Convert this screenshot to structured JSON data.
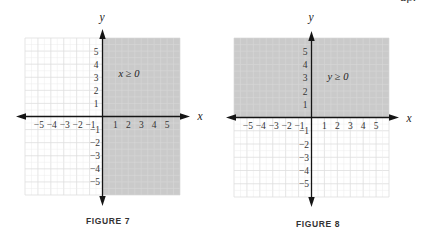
{
  "page": {
    "partial_text_visible": "up."
  },
  "colors": {
    "shade": "#cbcbcb",
    "grid_unshaded": "#dedede",
    "grid_shaded": "#d9d9d9",
    "axis": "#151515",
    "text": "#333333"
  },
  "figures": [
    {
      "caption": "FIGURE 7",
      "inequality": "x ≥ 0",
      "x_axis_label": "x",
      "y_axis_label": "y",
      "grid_extent": 6,
      "shaded_region": "x>=0",
      "x_ticks": [
        {
          "v": -5,
          "label": "−5"
        },
        {
          "v": -4,
          "label": "−4"
        },
        {
          "v": -3,
          "label": "−3"
        },
        {
          "v": -2,
          "label": "−2"
        },
        {
          "v": -1,
          "label": "−1"
        },
        {
          "v": 1,
          "label": "1"
        },
        {
          "v": 2,
          "label": "2"
        },
        {
          "v": 3,
          "label": "3"
        },
        {
          "v": 4,
          "label": "4"
        },
        {
          "v": 5,
          "label": "5"
        }
      ],
      "y_ticks": [
        {
          "v": 5,
          "label": "5"
        },
        {
          "v": 4,
          "label": "4"
        },
        {
          "v": 3,
          "label": "3"
        },
        {
          "v": 2,
          "label": "2"
        },
        {
          "v": 1,
          "label": "1"
        },
        {
          "v": -1,
          "label": "−1"
        },
        {
          "v": -2,
          "label": "−2"
        },
        {
          "v": -3,
          "label": "−3"
        },
        {
          "v": -4,
          "label": "−4"
        },
        {
          "v": -5,
          "label": "−5"
        }
      ]
    },
    {
      "caption": "FIGURE 8",
      "inequality": "y ≥ 0",
      "x_axis_label": "x",
      "y_axis_label": "y",
      "grid_extent": 6,
      "shaded_region": "y>=0",
      "x_ticks": [
        {
          "v": -5,
          "label": "−5"
        },
        {
          "v": -4,
          "label": "−4"
        },
        {
          "v": -3,
          "label": "−3"
        },
        {
          "v": -2,
          "label": "−2"
        },
        {
          "v": -1,
          "label": "−1"
        },
        {
          "v": 1,
          "label": "1"
        },
        {
          "v": 2,
          "label": "2"
        },
        {
          "v": 3,
          "label": "3"
        },
        {
          "v": 4,
          "label": "4"
        },
        {
          "v": 5,
          "label": "5"
        }
      ],
      "y_ticks": [
        {
          "v": 5,
          "label": "5"
        },
        {
          "v": 4,
          "label": "4"
        },
        {
          "v": 3,
          "label": "3"
        },
        {
          "v": 2,
          "label": "2"
        },
        {
          "v": 1,
          "label": "1"
        },
        {
          "v": -1,
          "label": "−1"
        },
        {
          "v": -2,
          "label": "−2"
        },
        {
          "v": -3,
          "label": "−3"
        },
        {
          "v": -4,
          "label": "−4"
        },
        {
          "v": -5,
          "label": "−5"
        }
      ]
    }
  ],
  "chart_data": [
    {
      "type": "area",
      "title": "FIGURE 7",
      "annotation": "x ≥ 0",
      "xlabel": "x",
      "ylabel": "y",
      "xlim": [
        -6,
        6
      ],
      "ylim": [
        -6,
        6
      ],
      "x_ticks": [
        -5,
        -4,
        -3,
        -2,
        -1,
        1,
        2,
        3,
        4,
        5
      ],
      "y_ticks": [
        -5,
        -4,
        -3,
        -2,
        -1,
        1,
        2,
        3,
        4,
        5
      ],
      "grid": true,
      "shaded_region": {
        "x": [
          0,
          6
        ],
        "y": [
          -6,
          6
        ],
        "description": "right half-plane including the y-axis"
      },
      "boundary": "x = 0 (solid line)"
    },
    {
      "type": "area",
      "title": "FIGURE 8",
      "annotation": "y ≥ 0",
      "xlabel": "x",
      "ylabel": "y",
      "xlim": [
        -6,
        6
      ],
      "ylim": [
        -6,
        6
      ],
      "x_ticks": [
        -5,
        -4,
        -3,
        -2,
        -1,
        1,
        2,
        3,
        4,
        5
      ],
      "y_ticks": [
        -5,
        -4,
        -3,
        -2,
        -1,
        1,
        2,
        3,
        4,
        5
      ],
      "grid": true,
      "shaded_region": {
        "x": [
          -6,
          6
        ],
        "y": [
          0,
          6
        ],
        "description": "upper half-plane including the x-axis"
      },
      "boundary": "y = 0 (solid line)"
    }
  ]
}
